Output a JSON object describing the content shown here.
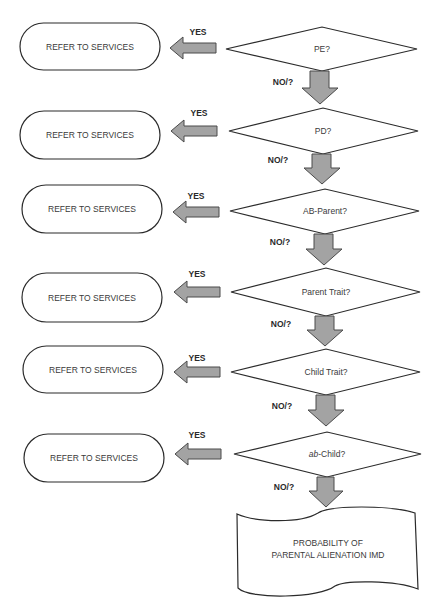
{
  "flowchart": {
    "decisions": [
      {
        "label": "PE?"
      },
      {
        "label": "PD?"
      },
      {
        "label": "AB-Parent?"
      },
      {
        "label": "Parent Trait?"
      },
      {
        "label": "Child Trait?"
      },
      {
        "label_italic": "ab",
        "label_rest": "-Child?"
      }
    ],
    "terminals": [
      {
        "label": "REFER TO SERVICES"
      },
      {
        "label": "REFER TO SERVICES"
      },
      {
        "label": "REFER TO SERVICES"
      },
      {
        "label": "REFER TO SERVICES"
      },
      {
        "label": "REFER TO SERVICES"
      },
      {
        "label": "REFER TO SERVICES"
      }
    ],
    "yes_label": "YES",
    "no_label": "NO/?",
    "outcome": {
      "line1": "PROBABILITY OF",
      "line2": "PARENTAL ALIENATION IMD"
    },
    "colors": {
      "arrow_fill": "#a3a3a3",
      "arrow_stroke": "#4a4a4a",
      "shape_stroke": "#2b2b2b"
    }
  }
}
